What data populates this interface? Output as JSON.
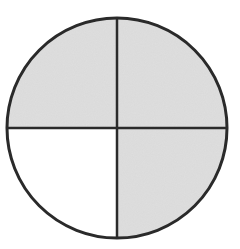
{
  "diagram": {
    "type": "fraction-circle",
    "total_parts": 4,
    "shaded_parts": 3,
    "fraction": "3/4",
    "quadrants": [
      {
        "position": "top-left",
        "shaded": true
      },
      {
        "position": "top-right",
        "shaded": true
      },
      {
        "position": "bottom-left",
        "shaded": false
      },
      {
        "position": "bottom-right",
        "shaded": true
      }
    ],
    "colors": {
      "shade": "#d9d9d9",
      "unshaded": "#ffffff",
      "stroke": "#2a2a2a"
    }
  }
}
